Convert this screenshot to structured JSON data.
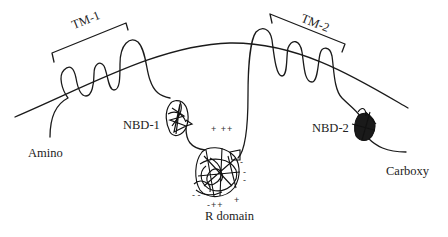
{
  "diagram": {
    "type": "protein-membrane-topology",
    "colors": {
      "line": "#1a1a1a",
      "text": "#222222",
      "background": "#ffffff"
    },
    "labels": {
      "tm1": "TM-1",
      "tm2": "TM-2",
      "nbd1": "NBD-1",
      "nbd2": "NBD-2",
      "r_domain": "R domain",
      "amino": "Amino",
      "carboxy": "Carboxy"
    },
    "charges": {
      "r_top": "+ ++",
      "r_right": [
        "-",
        "-",
        "-"
      ],
      "r_bottom_left": "- -",
      "r_bottom": "-++",
      "r_bottom_right": "+"
    },
    "nodes": [
      {
        "id": "membrane",
        "label": ""
      },
      {
        "id": "tm1",
        "label": "TM-1"
      },
      {
        "id": "nbd1",
        "label": "NBD-1"
      },
      {
        "id": "r_domain",
        "label": "R domain"
      },
      {
        "id": "tm2",
        "label": "TM-2"
      },
      {
        "id": "nbd2",
        "label": "NBD-2"
      }
    ],
    "edges": [
      {
        "from": "amino",
        "to": "tm1"
      },
      {
        "from": "tm1",
        "to": "nbd1"
      },
      {
        "from": "nbd1",
        "to": "r_domain"
      },
      {
        "from": "r_domain",
        "to": "tm2"
      },
      {
        "from": "tm2",
        "to": "nbd2"
      },
      {
        "from": "nbd2",
        "to": "carboxy"
      }
    ]
  }
}
